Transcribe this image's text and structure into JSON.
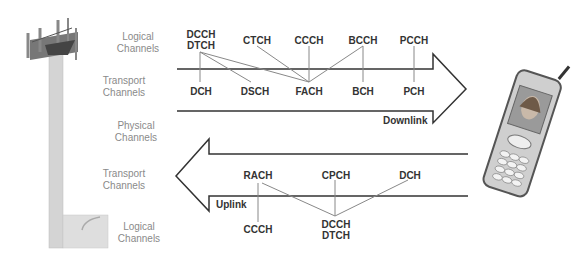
{
  "diagram": {
    "type": "UMTS channel mapping",
    "side_labels": {
      "downlink_logical": "Logical\nChannels",
      "downlink_transport": "Transport\nChannels",
      "physical": "Physical\nChannels",
      "uplink_transport": "Transport\nChannels",
      "uplink_logical": "Logical\nChannels"
    },
    "downlink": {
      "label": "Downlink",
      "logical_channels": [
        "DCCH\nDTCH",
        "CTCH",
        "CCCH",
        "BCCH",
        "PCCH"
      ],
      "transport_channels": [
        "DCH",
        "DSCH",
        "FACH",
        "BCH",
        "PCH"
      ],
      "mappings": [
        [
          "DCCH/DTCH",
          "DCH"
        ],
        [
          "DCCH/DTCH",
          "DSCH"
        ],
        [
          "DCCH/DTCH",
          "FACH"
        ],
        [
          "CTCH",
          "FACH"
        ],
        [
          "CCCH",
          "FACH"
        ],
        [
          "BCCH",
          "FACH"
        ],
        [
          "BCCH",
          "BCH"
        ],
        [
          "PCCH",
          "PCH"
        ]
      ]
    },
    "uplink": {
      "label": "Uplink",
      "transport_channels": [
        "RACH",
        "CPCH",
        "DCH"
      ],
      "logical_channels": [
        "CCCH",
        "DCCH\nDTCH"
      ],
      "mappings": [
        [
          "RACH",
          "CCCH"
        ],
        [
          "RACH",
          "DCCH/DTCH"
        ],
        [
          "CPCH",
          "DCCH/DTCH"
        ],
        [
          "DCH",
          "DCCH/DTCH"
        ]
      ]
    },
    "images": {
      "left": "cell-tower",
      "right": "mobile-phone"
    }
  }
}
